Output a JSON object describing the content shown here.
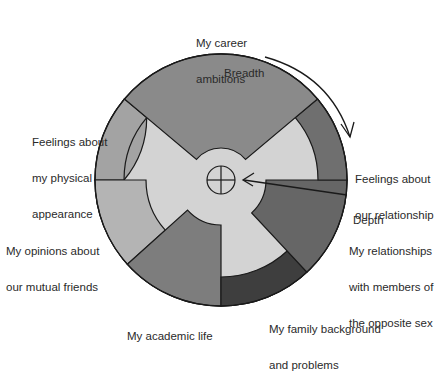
{
  "diagram": {
    "type": "social-penetration-model",
    "colors": {
      "background": "#ffffff",
      "inner_core": "#d3d3d3",
      "outline": "#1a1a1a",
      "career": "#8a8a8a",
      "relationship_feelings": "#6f6f6f",
      "opposite_sex": "#666666",
      "family": "#3e3e3e",
      "academic": "#7d7d7d",
      "friends_opinions": "#b4b4b4",
      "physical_appearance": "#a3a3a3"
    },
    "axis_labels": {
      "breadth": "Breadth",
      "depth": "Depth"
    },
    "segments": [
      {
        "id": "career",
        "lines": [
          "My career",
          "ambitions"
        ]
      },
      {
        "id": "relationship_feelings",
        "lines": [
          "Feelings about",
          "our relationship"
        ]
      },
      {
        "id": "opposite_sex",
        "lines": [
          "My relationships",
          "with members of",
          "the opposite sex"
        ]
      },
      {
        "id": "family",
        "lines": [
          "My family background",
          "and problems"
        ]
      },
      {
        "id": "academic",
        "lines": [
          "My academic life"
        ]
      },
      {
        "id": "friends_opinions",
        "lines": [
          "My opinions about",
          "our mutual friends"
        ]
      },
      {
        "id": "physical_appearance",
        "lines": [
          "Feelings about",
          "my physical",
          "appearance"
        ]
      }
    ]
  }
}
